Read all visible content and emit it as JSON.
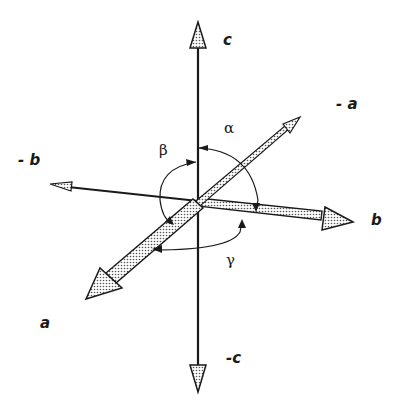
{
  "diagram": {
    "type": "crystallographic-axes",
    "axes": [
      {
        "id": "c",
        "label": "c"
      },
      {
        "id": "neg_c",
        "label": "-c"
      },
      {
        "id": "a",
        "label": "a"
      },
      {
        "id": "neg_a",
        "label": "- a"
      },
      {
        "id": "b",
        "label": "b"
      },
      {
        "id": "neg_b",
        "label": "- b"
      }
    ],
    "angles": [
      {
        "id": "alpha",
        "label": "α",
        "between": [
          "c",
          "b"
        ]
      },
      {
        "id": "beta",
        "label": "β",
        "between": [
          "c",
          "a"
        ]
      },
      {
        "id": "gamma",
        "label": "γ",
        "between": [
          "a",
          "b"
        ]
      }
    ],
    "colors": {
      "stroke": "#1a1a1a",
      "fill": "#d8d8d8",
      "background": "#ffffff"
    }
  }
}
